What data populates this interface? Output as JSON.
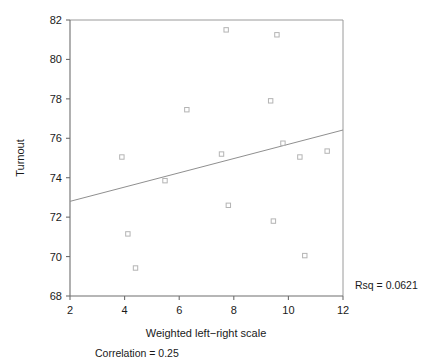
{
  "chart_data": {
    "type": "scatter",
    "title": "",
    "xlabel": "Weighted left−right scale",
    "ylabel": "Turnout",
    "xlim": [
      2,
      12
    ],
    "ylim": [
      68,
      82
    ],
    "xticks": [
      "2",
      "4",
      "6",
      "8",
      "10",
      "12"
    ],
    "xtick_values": [
      2,
      4,
      6,
      8,
      10,
      12
    ],
    "yticks": [
      "82",
      "80",
      "78",
      "76",
      "74",
      "72",
      "70",
      "68"
    ],
    "ytick_values": [
      82,
      80,
      78,
      76,
      74,
      72,
      70,
      68
    ],
    "grid": false,
    "legend": "none",
    "marker": "open-square",
    "points": [
      {
        "x": 3.9,
        "y": 75.05
      },
      {
        "x": 4.12,
        "y": 71.15
      },
      {
        "x": 4.4,
        "y": 69.42
      },
      {
        "x": 5.48,
        "y": 73.85
      },
      {
        "x": 6.28,
        "y": 77.45
      },
      {
        "x": 7.55,
        "y": 75.2
      },
      {
        "x": 7.72,
        "y": 81.5
      },
      {
        "x": 7.8,
        "y": 72.6
      },
      {
        "x": 9.35,
        "y": 77.9
      },
      {
        "x": 9.45,
        "y": 71.8
      },
      {
        "x": 9.58,
        "y": 81.25
      },
      {
        "x": 9.8,
        "y": 75.75
      },
      {
        "x": 10.42,
        "y": 75.05
      },
      {
        "x": 10.6,
        "y": 70.05
      },
      {
        "x": 11.42,
        "y": 75.35
      }
    ],
    "fit_line": {
      "x0": 2,
      "y0": 72.8,
      "x1": 12,
      "y1": 76.42,
      "slope": 0.362,
      "intercept": 72.076
    },
    "annotations": {
      "rsq": "Rsq = 0.0621",
      "correlation": "Correlation = 0.25"
    },
    "colors": {
      "marker_stroke": "#b4b4b4",
      "fit_line": "#8f8f8f",
      "axis": "#6e6e6e",
      "frame": "#9a9a9a",
      "text": "#1a1a1a",
      "background": "#ffffff"
    }
  }
}
